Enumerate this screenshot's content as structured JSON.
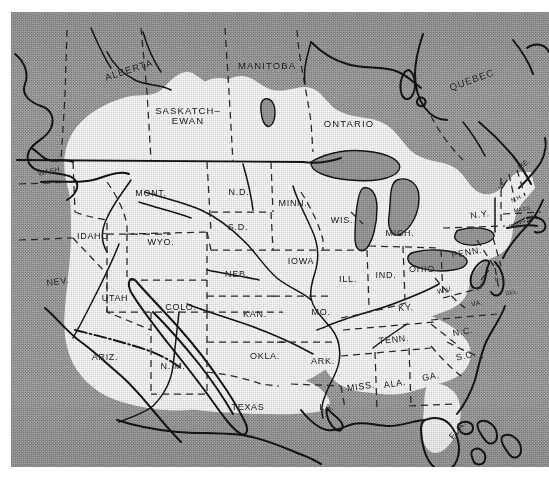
{
  "figure": {
    "type": "map",
    "projection_note": "conic, North America",
    "legend_note": "White area = glaciated region; stippled gray = unglaciated land and ocean"
  },
  "colors": {
    "land_unglaciated": "#a8a8a8",
    "glaciated_white": "#ffffff",
    "ink": "#141414",
    "lake_fill": "#9a9a9a",
    "paper": "#ffffff"
  },
  "provinces": [
    {
      "id": "alberta",
      "label": "ALBERTA",
      "x": 118,
      "y": 58,
      "rot": -18
    },
    {
      "id": "saskatchewan",
      "label": "SASKATCH–\nEWAN",
      "x": 177,
      "y": 104,
      "rot": 0
    },
    {
      "id": "manitoba",
      "label": "MANITOBA",
      "x": 256,
      "y": 54,
      "rot": 0
    },
    {
      "id": "ontario",
      "label": "ONTARIO",
      "x": 338,
      "y": 112,
      "rot": 0
    },
    {
      "id": "quebec",
      "label": "QUEBEC",
      "x": 461,
      "y": 68,
      "rot": -20
    }
  ],
  "states": [
    {
      "id": "wash",
      "label": "WASH.",
      "x": 39,
      "y": 159,
      "rot": -12,
      "size": "sm"
    },
    {
      "id": "mont",
      "label": "MONT.",
      "x": 140,
      "y": 182,
      "rot": 0,
      "size": "state"
    },
    {
      "id": "nd",
      "label": "N.D.",
      "x": 228,
      "y": 181,
      "rot": 0,
      "size": "state"
    },
    {
      "id": "minn",
      "label": "MINN.",
      "x": 282,
      "y": 192,
      "rot": 0,
      "size": "state"
    },
    {
      "id": "idaho",
      "label": "IDAHO",
      "x": 82,
      "y": 225,
      "rot": 0,
      "size": "state"
    },
    {
      "id": "wyo",
      "label": "WYO.",
      "x": 150,
      "y": 231,
      "rot": 0,
      "size": "state"
    },
    {
      "id": "sd",
      "label": "S.D.",
      "x": 227,
      "y": 216,
      "rot": 0,
      "size": "state"
    },
    {
      "id": "wis",
      "label": "WIS.",
      "x": 331,
      "y": 209,
      "rot": 0,
      "size": "state"
    },
    {
      "id": "mich",
      "label": "MICH.",
      "x": 389,
      "y": 222,
      "rot": 0,
      "size": "state"
    },
    {
      "id": "neb",
      "label": "NEB.",
      "x": 226,
      "y": 263,
      "rot": 0,
      "size": "state"
    },
    {
      "id": "iowa",
      "label": "IOWA",
      "x": 290,
      "y": 250,
      "rot": 0,
      "size": "state"
    },
    {
      "id": "ill",
      "label": "ILL.",
      "x": 337,
      "y": 268,
      "rot": 0,
      "size": "state"
    },
    {
      "id": "ind",
      "label": "IND.",
      "x": 375,
      "y": 264,
      "rot": 0,
      "size": "state"
    },
    {
      "id": "ohio",
      "label": "OHIO",
      "x": 411,
      "y": 258,
      "rot": 0,
      "size": "state"
    },
    {
      "id": "penn",
      "label": "PENN.",
      "x": 456,
      "y": 241,
      "rot": -10,
      "size": "state"
    },
    {
      "id": "ny",
      "label": "N.Y.",
      "x": 469,
      "y": 203,
      "rot": -8,
      "size": "state"
    },
    {
      "id": "me",
      "label": "ME.",
      "x": 513,
      "y": 152,
      "rot": -38,
      "size": "sm"
    },
    {
      "id": "vt",
      "label": "VT.",
      "x": 492,
      "y": 174,
      "rot": -50,
      "size": "xs"
    },
    {
      "id": "nh",
      "label": "N.H.",
      "x": 506,
      "y": 187,
      "rot": -24,
      "size": "xs"
    },
    {
      "id": "mass",
      "label": "MASS.",
      "x": 512,
      "y": 198,
      "rot": -8,
      "size": "xs"
    },
    {
      "id": "conn",
      "label": "CONN.",
      "x": 507,
      "y": 212,
      "rot": -22,
      "size": "xs"
    },
    {
      "id": "ri",
      "label": "R.I.",
      "x": 520,
      "y": 206,
      "rot": -26,
      "size": "xs"
    },
    {
      "id": "nj",
      "label": "N.J.",
      "x": 489,
      "y": 267,
      "rot": -12,
      "size": "xs"
    },
    {
      "id": "del",
      "label": "DEL.",
      "x": 501,
      "y": 281,
      "rot": -10,
      "size": "xs"
    },
    {
      "id": "md",
      "label": "MD.",
      "x": 472,
      "y": 272,
      "rot": -62,
      "size": "xs"
    },
    {
      "id": "wv",
      "label": "W.V.",
      "x": 434,
      "y": 278,
      "rot": -12,
      "size": "sm"
    },
    {
      "id": "va",
      "label": "VA.",
      "x": 466,
      "y": 291,
      "rot": -10,
      "size": "sm"
    },
    {
      "id": "nev",
      "label": "NEV.",
      "x": 47,
      "y": 270,
      "rot": -8,
      "size": "state"
    },
    {
      "id": "utah",
      "label": "UTAH",
      "x": 104,
      "y": 287,
      "rot": 0,
      "size": "state"
    },
    {
      "id": "colo",
      "label": "COLO.",
      "x": 170,
      "y": 296,
      "rot": 0,
      "size": "state"
    },
    {
      "id": "kan",
      "label": "KAN.",
      "x": 244,
      "y": 303,
      "rot": 0,
      "size": "state"
    },
    {
      "id": "mo",
      "label": "MO.",
      "x": 310,
      "y": 301,
      "rot": 0,
      "size": "state"
    },
    {
      "id": "ky",
      "label": "KY.",
      "x": 395,
      "y": 296,
      "rot": -6,
      "size": "state"
    },
    {
      "id": "ariz",
      "label": "ARIZ.",
      "x": 94,
      "y": 346,
      "rot": 0,
      "size": "state"
    },
    {
      "id": "nm",
      "label": "N. M.",
      "x": 162,
      "y": 355,
      "rot": 0,
      "size": "state"
    },
    {
      "id": "okla",
      "label": "OKLA.",
      "x": 254,
      "y": 345,
      "rot": 0,
      "size": "state"
    },
    {
      "id": "ark",
      "label": "ARK.",
      "x": 312,
      "y": 350,
      "rot": 0,
      "size": "state"
    },
    {
      "id": "tenn",
      "label": "TENN.",
      "x": 383,
      "y": 328,
      "rot": -6,
      "size": "state"
    },
    {
      "id": "nc",
      "label": "N.C.",
      "x": 452,
      "y": 320,
      "rot": -10,
      "size": "state"
    },
    {
      "id": "sc",
      "label": "S.C.",
      "x": 455,
      "y": 344,
      "rot": -14,
      "size": "state"
    },
    {
      "id": "ga",
      "label": "GA.",
      "x": 420,
      "y": 365,
      "rot": -10,
      "size": "state"
    },
    {
      "id": "ala",
      "label": "ALA.",
      "x": 384,
      "y": 372,
      "rot": -8,
      "size": "state"
    },
    {
      "id": "miss",
      "label": "MISS.",
      "x": 350,
      "y": 375,
      "rot": -8,
      "size": "state"
    },
    {
      "id": "texas",
      "label": "TEXAS",
      "x": 237,
      "y": 396,
      "rot": 0,
      "size": "state"
    },
    {
      "id": "la",
      "label": "LA.",
      "x": 316,
      "y": 396,
      "rot": 0,
      "size": "state"
    },
    {
      "id": "fla",
      "label": "FLA.",
      "x": 447,
      "y": 418,
      "rot": -52,
      "size": "state"
    }
  ]
}
